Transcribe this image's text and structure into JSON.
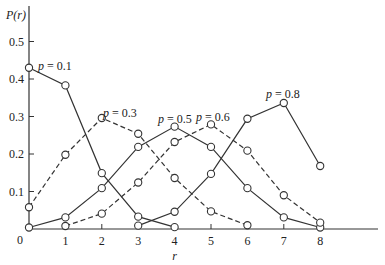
{
  "chart_data": {
    "type": "line",
    "title": "",
    "xlabel": "r",
    "ylabel": "P(r)",
    "x": [
      0,
      1,
      2,
      3,
      4,
      5,
      6,
      7,
      8
    ],
    "x_ticks": [
      "0",
      "1",
      "2",
      "3",
      "4",
      "5",
      "6",
      "7",
      "8"
    ],
    "y_ticks": [
      "0.1",
      "0.2",
      "0.3",
      "0.4",
      "0.5"
    ],
    "xlim": [
      0,
      9.5
    ],
    "ylim": [
      0,
      0.6
    ],
    "grid": false,
    "legend": "inline labels",
    "series": [
      {
        "name": "p = 0.1",
        "style": "solid",
        "x": [
          0,
          1,
          2,
          3,
          4
        ],
        "values": [
          0.43,
          0.383,
          0.149,
          0.033,
          0.005
        ]
      },
      {
        "name": "p = 0.3",
        "style": "dashed",
        "x": [
          0,
          1,
          2,
          3,
          4,
          5,
          6
        ],
        "values": [
          0.058,
          0.198,
          0.296,
          0.254,
          0.136,
          0.047,
          0.01
        ]
      },
      {
        "name": "p = 0.5",
        "style": "solid",
        "x": [
          0,
          1,
          2,
          3,
          4,
          5,
          6,
          7,
          8
        ],
        "values": [
          0.004,
          0.031,
          0.109,
          0.219,
          0.273,
          0.219,
          0.109,
          0.031,
          0.004
        ]
      },
      {
        "name": "p = 0.6",
        "style": "dashed",
        "x": [
          1,
          2,
          3,
          4,
          5,
          6,
          7,
          8
        ],
        "values": [
          0.008,
          0.041,
          0.124,
          0.232,
          0.279,
          0.209,
          0.09,
          0.017
        ]
      },
      {
        "name": "p = 0.8",
        "style": "solid",
        "x": [
          3,
          4,
          5,
          6,
          7,
          8
        ],
        "values": [
          0.009,
          0.046,
          0.147,
          0.294,
          0.336,
          0.168
        ]
      }
    ],
    "annotations": [
      {
        "text": "p = 0.1",
        "series": "p = 0.1"
      },
      {
        "text": "p = 0.3",
        "series": "p = 0.3"
      },
      {
        "text": "p = 0.5",
        "series": "p = 0.5"
      },
      {
        "text": "p = 0.6",
        "series": "p = 0.6"
      },
      {
        "text": "p = 0.8",
        "series": "p = 0.8"
      }
    ]
  },
  "labels": {
    "origin": "0",
    "ylabel_main": "P(r)",
    "xlabel": "r"
  }
}
